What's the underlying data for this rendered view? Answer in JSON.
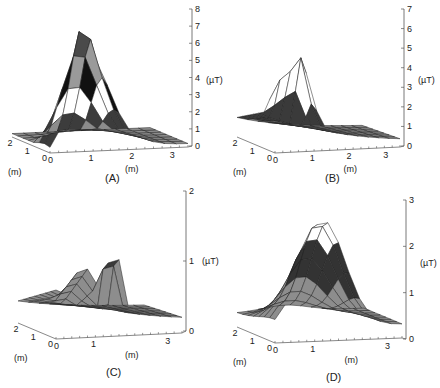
{
  "figure": {
    "panel_labels": [
      "(A)",
      "(B)",
      "(C)",
      "(D)"
    ],
    "unit_field": "(µT)",
    "unit_space": "(m)"
  },
  "chart_data": [
    {
      "panel": "(A)",
      "type": "surface3d",
      "zlabel": "(µT)",
      "xlabel": "(m)",
      "ylabel": "(m)",
      "x_ticks": [
        0,
        1,
        2,
        3
      ],
      "y_ticks": [
        0,
        1,
        2
      ],
      "z_ticks": [
        0,
        1,
        2,
        3,
        4,
        5,
        6,
        7,
        8
      ],
      "zlim": [
        0,
        8
      ],
      "peak_value": 7.5,
      "description": "Single sharp peak (~7.5 µT) near x≈0.5 m, y≈0, falling to ~1-2 µT ridge and ~0.2 µT at far x"
    },
    {
      "panel": "(B)",
      "type": "surface3d",
      "zlabel": "(µT)",
      "xlabel": "(m)",
      "ylabel": "(m)",
      "x_ticks": [
        0,
        1,
        2,
        3
      ],
      "y_ticks": [
        0,
        1,
        2
      ],
      "z_ticks": [
        0,
        1,
        2,
        3,
        4,
        5,
        6,
        7
      ],
      "zlim": [
        0,
        7
      ],
      "peak_value": 5.9,
      "secondary_peak": 4.5,
      "description": "Twin peaks (~4.5 µT and ~5.9 µT) near x≈0-0.5 m, plateau ~2 µT, decaying to ~0.2 µT at x=3 m"
    },
    {
      "panel": "(C)",
      "type": "surface3d",
      "zlabel": "(µT)",
      "xlabel": "(m)",
      "ylabel": "(m)",
      "x_ticks": [
        0,
        1,
        3
      ],
      "y_ticks": [
        0,
        1,
        2
      ],
      "z_ticks": [
        0,
        1,
        2
      ],
      "zlim": [
        0,
        2
      ],
      "peak_value": 1.4,
      "description": "Low surface with broad hump (~1.0 µT) and local peak (~1.4 µT) near x≈1 m"
    },
    {
      "panel": "(D)",
      "type": "surface3d",
      "zlabel": "(µT)",
      "xlabel": "(m)",
      "ylabel": "(m)",
      "x_ticks": [
        0,
        1,
        3
      ],
      "y_ticks": [
        0,
        1,
        2
      ],
      "z_ticks": [
        0,
        1,
        2,
        3
      ],
      "zlim": [
        0,
        3
      ],
      "peak_value": 2.6,
      "description": "Smooth dome peaking ~2.6 µT near x≈1 m, decaying to ~0.3 µT at x=3 m"
    }
  ]
}
